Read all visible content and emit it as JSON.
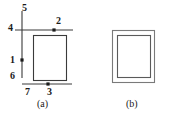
{
  "figure": {
    "stroke_color": "#3a3a3a",
    "text_color": "#1a1a1a",
    "background_color": "#ffffff",
    "panels": [
      {
        "id": "a",
        "caption": "(a)",
        "description": "square outline with crossing reference lines and numbered node labels",
        "labels": [
          {
            "id": "label-5",
            "text": "5",
            "x": 22,
            "y": 3,
            "role": "top-vertical-line-end"
          },
          {
            "id": "label-4",
            "text": "4",
            "x": 8,
            "y": 23,
            "role": "left-horizontal-line-end"
          },
          {
            "id": "label-2",
            "text": "2",
            "x": 56,
            "y": 16,
            "role": "top-edge-node"
          },
          {
            "id": "label-1",
            "text": "1",
            "x": 10,
            "y": 57,
            "role": "left-edge-node"
          },
          {
            "id": "label-6",
            "text": "6",
            "x": 10,
            "y": 73,
            "role": "lower-vertical-line-end"
          },
          {
            "id": "label-7",
            "text": "7",
            "x": 25,
            "y": 89,
            "role": "bottom-left-corner"
          },
          {
            "id": "label-3",
            "text": "3",
            "x": 47,
            "y": 89,
            "role": "bottom-edge-node"
          }
        ],
        "nodes": [
          {
            "id": "node-2",
            "cx": 54,
            "cy": 30
          },
          {
            "id": "node-1",
            "cx": 22,
            "cy": 60
          },
          {
            "id": "node-3",
            "cx": 48,
            "cy": 84
          }
        ]
      },
      {
        "id": "b",
        "caption": "(b)",
        "description": "nested double rectangle outline, inner offset down and right"
      }
    ]
  }
}
